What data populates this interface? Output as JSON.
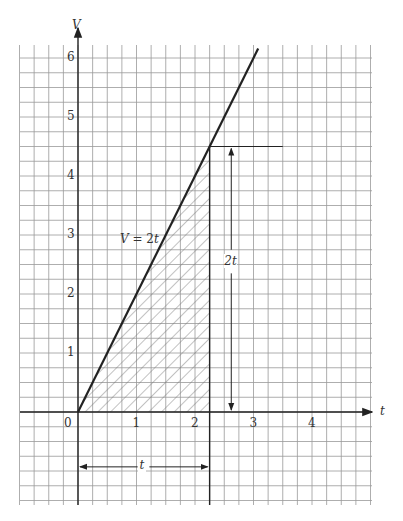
{
  "chart_data": {
    "type": "line",
    "title": "",
    "xlabel": "t",
    "ylabel": "V",
    "xlim": [
      -1,
      5
    ],
    "ylim": [
      -1.6,
      6.3
    ],
    "grid": true,
    "grid_step": 0.25,
    "x_ticks": [
      "0",
      "1",
      "2",
      "3",
      "4"
    ],
    "y_ticks": [
      "1",
      "2",
      "3",
      "4",
      "5",
      "6"
    ],
    "series": [
      {
        "name": "V = 2t",
        "x": [
          0,
          3.08
        ],
        "y": [
          0,
          6.16
        ]
      }
    ],
    "annotations": {
      "line_label": "V = 2t",
      "shaded_region": {
        "x": [
          0,
          2.25
        ],
        "description": "area under V = 2t from 0 to t"
      },
      "vertical_arrow_label": "2t",
      "horizontal_arrow_label": "t",
      "t_marker": 2.25,
      "height_at_t": 4.5
    }
  }
}
